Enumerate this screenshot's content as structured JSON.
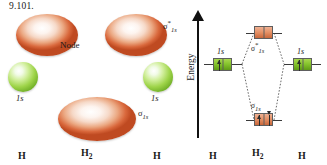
{
  "figure": {
    "number": "9.101.",
    "kind": "molecular-orbital-diagram",
    "molecule": "H2"
  },
  "orbital_panel": {
    "node_label": "Node",
    "antibonding_label": {
      "sigma": "σ",
      "star": "*",
      "sub": "1s"
    },
    "bonding_label": {
      "sigma": "σ",
      "sub": "1s"
    },
    "atomic_orbital_left": "1s",
    "atomic_orbital_right": "1s",
    "atoms": [
      {
        "label": "H",
        "sub": ""
      },
      {
        "label": "H",
        "sub": "2"
      },
      {
        "label": "H",
        "sub": ""
      }
    ],
    "colors": {
      "antibonding_orbital": "#d9683c",
      "bonding_orbital": "#d9683c",
      "atomic_orbital": "#9ed449"
    }
  },
  "mo_panel": {
    "axis_label": "Energy",
    "levels": [
      {
        "name": "1s-left",
        "label": "1s",
        "electrons": 1,
        "color": "#84c32c"
      },
      {
        "name": "sigma-star-1s",
        "label": "σ*1s",
        "sigma": "σ",
        "star": "*",
        "sub": "1s",
        "electrons": 0,
        "color": "#e59166"
      },
      {
        "name": "sigma-1s",
        "label": "σ1s",
        "sigma": "σ",
        "sub": "1s",
        "electrons": 2,
        "color": "#e59166"
      },
      {
        "name": "1s-right",
        "label": "1s",
        "electrons": 1,
        "color": "#84c32c"
      }
    ],
    "atoms": [
      {
        "label": "H",
        "sub": ""
      },
      {
        "label": "H",
        "sub": "2"
      },
      {
        "label": "H",
        "sub": ""
      }
    ],
    "colors": {
      "axis": "#111111",
      "correlation_line": "#5a5a5a",
      "atomic_box": "#84c32c",
      "molecular_box": "#e59166"
    }
  }
}
